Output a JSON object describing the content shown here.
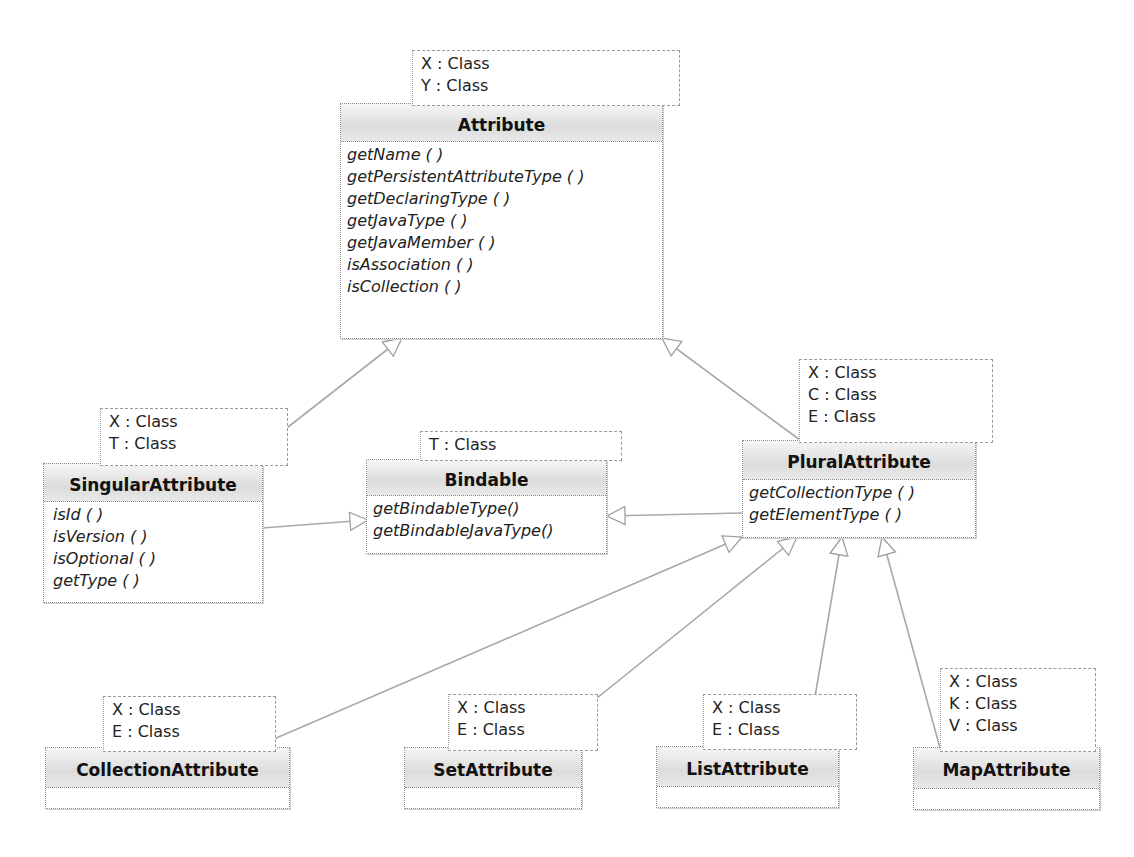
{
  "diagram": {
    "type": "UML class diagram",
    "classes": {
      "attribute": {
        "name": "Attribute",
        "type_params": [
          "X : Class",
          "Y : Class"
        ],
        "operations": [
          "getName ( )",
          "getPersistentAttributeType ( )",
          "getDeclaringType ( )",
          "getJavaType ( )",
          "getJavaMember ( )",
          "isAssociation ( )",
          "isCollection ( )"
        ]
      },
      "singular": {
        "name": "SingularAttribute",
        "type_params": [
          "X : Class",
          "T : Class"
        ],
        "operations": [
          "isId ( )",
          "isVersion ( )",
          "isOptional ( )",
          "getType ( )"
        ]
      },
      "bindable": {
        "name": "Bindable",
        "type_params": [
          "T : Class"
        ],
        "operations": [
          "getBindableType()",
          "getBindableJavaType()"
        ]
      },
      "plural": {
        "name": "PluralAttribute",
        "type_params": [
          "X : Class",
          "C : Class",
          "E : Class"
        ],
        "operations": [
          "getCollectionType ( )",
          "getElementType ( )"
        ]
      },
      "collection": {
        "name": "CollectionAttribute",
        "type_params": [
          "X : Class",
          "E : Class"
        ],
        "operations": []
      },
      "set": {
        "name": "SetAttribute",
        "type_params": [
          "X : Class",
          "E : Class"
        ],
        "operations": []
      },
      "list": {
        "name": "ListAttribute",
        "type_params": [
          "X : Class",
          "E : Class"
        ],
        "operations": []
      },
      "map": {
        "name": "MapAttribute",
        "type_params": [
          "X : Class",
          "K : Class",
          "V : Class"
        ],
        "operations": []
      }
    },
    "relations": [
      {
        "from": "SingularAttribute",
        "to": "Attribute",
        "kind": "generalization"
      },
      {
        "from": "PluralAttribute",
        "to": "Attribute",
        "kind": "generalization"
      },
      {
        "from": "SingularAttribute",
        "to": "Bindable",
        "kind": "generalization"
      },
      {
        "from": "PluralAttribute",
        "to": "Bindable",
        "kind": "generalization"
      },
      {
        "from": "CollectionAttribute",
        "to": "PluralAttribute",
        "kind": "generalization"
      },
      {
        "from": "SetAttribute",
        "to": "PluralAttribute",
        "kind": "generalization"
      },
      {
        "from": "ListAttribute",
        "to": "PluralAttribute",
        "kind": "generalization"
      },
      {
        "from": "MapAttribute",
        "to": "PluralAttribute",
        "kind": "generalization"
      }
    ],
    "colors": {
      "line": "#a0a0a0",
      "header_gradient_top": "#f6f6f6",
      "header_gradient_bottom": "#dcdcdc",
      "border": "#8a8a8a"
    }
  }
}
